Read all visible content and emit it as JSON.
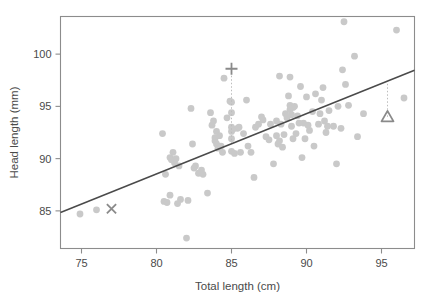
{
  "chart_data": {
    "type": "scatter",
    "title": "",
    "xlabel": "Total length (cm)",
    "ylabel": "Head length (mm)",
    "xlim": [
      73.6,
      97.2
    ],
    "ylim": [
      81.4,
      103.6
    ],
    "xticks": [
      75,
      80,
      85,
      90,
      95
    ],
    "xtick_labels": [
      "75",
      "80",
      "85",
      "90",
      "95"
    ],
    "yticks": [
      85,
      90,
      95,
      100
    ],
    "ytick_labels": [
      "85",
      "90",
      "95",
      "100"
    ],
    "grid": false,
    "legend": null,
    "point_color": "#c9c9c9",
    "line_color": "#4a4a4a",
    "marker_color": "#8a8a8a",
    "frame_color": "#8c8c8c",
    "regression_line": {
      "name": "fitted least-squares line",
      "x_start": 73.6,
      "y_start": 84.85,
      "x_end": 97.2,
      "y_end": 98.45,
      "slope": 0.576,
      "intercept": 42.46
    },
    "annotations": [
      {
        "name": "cross-marker",
        "symbol": "x",
        "x": 77.0,
        "y": 85.2,
        "label": ""
      },
      {
        "name": "plus-marker",
        "symbol": "+",
        "x": 85.0,
        "y": 98.6,
        "label": "",
        "dropline_to": {
          "x": 85.0,
          "y": 91.5
        }
      },
      {
        "name": "triangle-marker",
        "symbol": "triangle",
        "x": 95.4,
        "y": 94.0,
        "label": "",
        "dropline_to": {
          "x": 95.4,
          "y": 97.4
        }
      }
    ],
    "points": [
      [
        74.9,
        84.7
      ],
      [
        76.0,
        85.1
      ],
      [
        80.4,
        92.4
      ],
      [
        80.5,
        85.9
      ],
      [
        80.6,
        88.5
      ],
      [
        80.7,
        85.8
      ],
      [
        80.9,
        90.1
      ],
      [
        80.9,
        86.5
      ],
      [
        81.0,
        89.9
      ],
      [
        81.1,
        90.6
      ],
      [
        81.2,
        89.6
      ],
      [
        81.3,
        90.0
      ],
      [
        81.4,
        85.7
      ],
      [
        81.5,
        89.3
      ],
      [
        81.6,
        86.1
      ],
      [
        82.0,
        82.4
      ],
      [
        82.1,
        86.0
      ],
      [
        82.3,
        94.8
      ],
      [
        82.4,
        91.4
      ],
      [
        82.5,
        89.1
      ],
      [
        82.6,
        89.3
      ],
      [
        82.8,
        88.6
      ],
      [
        83.0,
        88.9
      ],
      [
        83.1,
        88.5
      ],
      [
        83.4,
        86.7
      ],
      [
        83.6,
        94.4
      ],
      [
        83.7,
        93.2
      ],
      [
        83.8,
        93.6
      ],
      [
        83.9,
        92.0
      ],
      [
        83.9,
        91.7
      ],
      [
        84.0,
        92.6
      ],
      [
        84.0,
        91.4
      ],
      [
        84.1,
        91.0
      ],
      [
        84.2,
        92.2
      ],
      [
        84.3,
        91.2
      ],
      [
        84.4,
        90.6
      ],
      [
        84.5,
        97.7
      ],
      [
        84.7,
        93.9
      ],
      [
        84.9,
        95.5
      ],
      [
        85.0,
        95.4
      ],
      [
        85.0,
        94.4
      ],
      [
        85.0,
        93.0
      ],
      [
        85.0,
        92.6
      ],
      [
        85.0,
        91.9
      ],
      [
        85.0,
        90.7
      ],
      [
        85.1,
        92.8
      ],
      [
        85.2,
        90.5
      ],
      [
        85.4,
        92.9
      ],
      [
        85.5,
        93.0
      ],
      [
        85.6,
        90.6
      ],
      [
        85.8,
        92.4
      ],
      [
        86.0,
        95.6
      ],
      [
        86.1,
        91.2
      ],
      [
        86.3,
        90.6
      ],
      [
        86.5,
        88.2
      ],
      [
        86.6,
        93.0
      ],
      [
        86.8,
        93.3
      ],
      [
        87.0,
        94.0
      ],
      [
        87.1,
        93.7
      ],
      [
        87.3,
        92.1
      ],
      [
        87.5,
        91.8
      ],
      [
        87.6,
        93.3
      ],
      [
        87.8,
        89.5
      ],
      [
        88.0,
        93.6
      ],
      [
        88.0,
        92.2
      ],
      [
        88.1,
        91.4
      ],
      [
        88.2,
        97.9
      ],
      [
        88.2,
        91.7
      ],
      [
        88.3,
        93.3
      ],
      [
        88.4,
        91.1
      ],
      [
        88.5,
        92.3
      ],
      [
        88.6,
        94.3
      ],
      [
        88.7,
        93.9
      ],
      [
        88.8,
        96.0
      ],
      [
        88.9,
        97.8
      ],
      [
        88.9,
        95.1
      ],
      [
        88.9,
        94.7
      ],
      [
        89.0,
        94.2
      ],
      [
        89.0,
        93.1
      ],
      [
        89.1,
        94.9
      ],
      [
        89.1,
        91.9
      ],
      [
        89.2,
        95.0
      ],
      [
        89.3,
        92.4
      ],
      [
        89.4,
        94.1
      ],
      [
        89.5,
        93.4
      ],
      [
        89.6,
        96.9
      ],
      [
        89.7,
        90.1
      ],
      [
        89.8,
        93.4
      ],
      [
        89.9,
        91.9
      ],
      [
        90.0,
        95.9
      ],
      [
        90.1,
        93.2
      ],
      [
        90.2,
        92.7
      ],
      [
        90.4,
        94.5
      ],
      [
        90.5,
        91.2
      ],
      [
        90.6,
        96.2
      ],
      [
        90.8,
        93.3
      ],
      [
        90.9,
        94.3
      ],
      [
        91.0,
        95.6
      ],
      [
        91.1,
        96.8
      ],
      [
        91.2,
        93.6
      ],
      [
        91.3,
        92.5
      ],
      [
        91.4,
        93.1
      ],
      [
        91.5,
        94.6
      ],
      [
        91.8,
        93.1
      ],
      [
        92.0,
        89.5
      ],
      [
        92.1,
        95.0
      ],
      [
        92.3,
        92.9
      ],
      [
        92.4,
        98.5
      ],
      [
        92.5,
        103.1
      ],
      [
        92.6,
        97.1
      ],
      [
        92.8,
        95.1
      ],
      [
        93.2,
        99.8
      ],
      [
        93.4,
        92.1
      ],
      [
        93.8,
        94.3
      ],
      [
        96.0,
        102.3
      ],
      [
        96.5,
        95.8
      ]
    ]
  }
}
